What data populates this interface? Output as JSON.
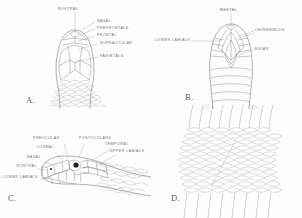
{
  "plate": {
    "title": "Snake head scalation and body scale row diagram",
    "background_color": "#fdfdfc",
    "ink_color": "#6f6f6d",
    "label_color": "#6e6e6c"
  },
  "panels": [
    {
      "letter": "A.",
      "view": "dorsal-head",
      "labels": [
        {
          "text": "ROSTRAL"
        },
        {
          "text": "NASAL"
        },
        {
          "text": "PREFRONTALS"
        },
        {
          "text": "FRONTAL"
        },
        {
          "text": "SUPRAOCULAR"
        },
        {
          "text": "PARIETALS"
        }
      ]
    },
    {
      "letter": "B.",
      "view": "ventral-head",
      "labels": [
        {
          "text": "MENTAL"
        },
        {
          "text": "CHINSHIELDS"
        },
        {
          "text": "LOWER LABIALS"
        },
        {
          "text": "GULAR"
        }
      ]
    },
    {
      "letter": "C.",
      "view": "lateral-head",
      "labels": [
        {
          "text": "PREOCULAR"
        },
        {
          "text": "POSTOCULARS"
        },
        {
          "text": "LOREAL"
        },
        {
          "text": "TEMPORAL"
        },
        {
          "text": "UPPER LABIALS"
        },
        {
          "text": "NASAL"
        },
        {
          "text": "ROSTRAL"
        },
        {
          "text": "LOWER LABIALS"
        }
      ]
    },
    {
      "letter": "D.",
      "view": "body-scale-rows",
      "labels": []
    }
  ]
}
